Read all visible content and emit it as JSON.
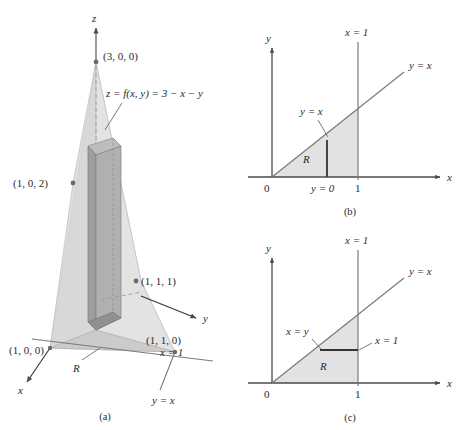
{
  "figure": {
    "colors": {
      "axis": "#4a4a4a",
      "line": "#6b6b6b",
      "text": "#2b2b2b",
      "plane_fill": "#d9d9d9",
      "plane_fill_light": "#e4e4e4",
      "base_fill": "#cfcfcf",
      "column_fill": "#a9a9a9",
      "column_fill_dark": "#8f8f8f",
      "region_fill": "#e0e0e0",
      "slice_line": "#3a3a3a",
      "dashed": "#9a9a9a"
    }
  },
  "panel_a": {
    "caption": "(a)",
    "axes": {
      "z": "z",
      "y": "y",
      "x": "x"
    },
    "points": [
      {
        "label": "(3, 0, 0)",
        "name": "point-3-0-0"
      },
      {
        "label": "(1, 0, 2)",
        "name": "point-1-0-2"
      },
      {
        "label": "(1, 1, 1)",
        "name": "point-1-1-1"
      },
      {
        "label": "(1, 0, 0)",
        "name": "point-1-0-0"
      },
      {
        "label": "(1, 1, 0)",
        "name": "point-1-1-0"
      }
    ],
    "surface_equation": "z = f(x, y) = 3 − x − y",
    "region_label": "R",
    "line_labels": [
      {
        "label": "x = 1",
        "name": "line-label-x-equals-1"
      },
      {
        "label": "y = x",
        "name": "line-label-y-equals-x"
      }
    ]
  },
  "panel_b": {
    "caption": "(b)",
    "axis_x": "x",
    "axis_y": "y",
    "origin": "0",
    "tick_x_1": "1",
    "vertical_line": "x = 1",
    "diagonal_line": "y = x",
    "upper_limit": "y = x",
    "lower_limit": "y = 0",
    "region_label": "R"
  },
  "panel_c": {
    "caption": "(c)",
    "axis_x": "x",
    "axis_y": "y",
    "origin": "0",
    "tick_x_1": "1",
    "vertical_line": "x = 1",
    "diagonal_line": "y = x",
    "left_limit": "x = y",
    "right_limit": "x = 1",
    "region_label": "R"
  }
}
